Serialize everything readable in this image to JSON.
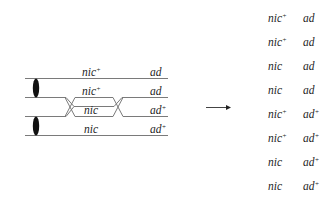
{
  "diagram": {
    "type": "genetic-crossover",
    "chromatids": [
      {
        "gene1": "nic",
        "sup1": "+",
        "gene2": "ad",
        "sup2": ""
      },
      {
        "gene1": "nic",
        "sup1": "+",
        "gene2": "ad",
        "sup2": ""
      },
      {
        "gene1": "nic",
        "sup1": "",
        "gene2": "ad",
        "sup2": "+"
      },
      {
        "gene1": "nic",
        "sup1": "",
        "gene2": "ad",
        "sup2": "+"
      }
    ],
    "crossovers": [
      {
        "between_chromatids": [
          2,
          3
        ],
        "position": "between centromere and nic"
      },
      {
        "between_chromatids": [
          2,
          3
        ],
        "position": "between nic and ad"
      }
    ],
    "centromeres": 2,
    "arrow": "right",
    "products": [
      {
        "gene1": "nic",
        "sup1": "+",
        "gene2": "ad",
        "sup2": ""
      },
      {
        "gene1": "nic",
        "sup1": "+",
        "gene2": "ad",
        "sup2": ""
      },
      {
        "gene1": "nic",
        "sup1": "",
        "gene2": "ad",
        "sup2": ""
      },
      {
        "gene1": "nic",
        "sup1": "",
        "gene2": "ad",
        "sup2": ""
      },
      {
        "gene1": "nic",
        "sup1": "+",
        "gene2": "ad",
        "sup2": "+"
      },
      {
        "gene1": "nic",
        "sup1": "+",
        "gene2": "ad",
        "sup2": "+"
      },
      {
        "gene1": "nic",
        "sup1": "",
        "gene2": "ad",
        "sup2": "+"
      },
      {
        "gene1": "nic",
        "sup1": "",
        "gene2": "ad",
        "sup2": "+"
      }
    ]
  },
  "colors": {
    "line": "#7a7a7a",
    "centromere": "#111111",
    "text": "#1e1e1e"
  }
}
